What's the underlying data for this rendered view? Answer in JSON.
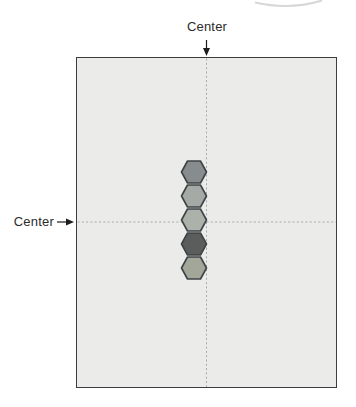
{
  "figure": {
    "labels": {
      "top_center": "Center",
      "left_center": "Center"
    }
  },
  "colors": {
    "page_background": "#ffffff",
    "board_fill": "#ebebea",
    "board_border": "#3d3d3d",
    "center_line": "#a9a9a9",
    "arrow": "#1d1d1d",
    "label_text": "#2b2b2b",
    "hexagon_stroke": "#3e4345",
    "clipped_arc": "#cdcdcd"
  },
  "geometry": {
    "board": {
      "left": 76,
      "top": 57,
      "width": 261,
      "height": 331
    },
    "vertical_center_x": 206.5,
    "horizontal_center_y": 222
  },
  "hexagon_size": {
    "width": 25,
    "height": 22
  },
  "hexagons": [
    {
      "cx": 194,
      "cy": 172,
      "fill": "#878c8e"
    },
    {
      "cx": 194,
      "cy": 196,
      "fill": "#a5aaa7"
    },
    {
      "cx": 194,
      "cy": 220,
      "fill": "#acb1aa"
    },
    {
      "cx": 194,
      "cy": 244,
      "fill": "#5a5d5c"
    },
    {
      "cx": 194,
      "cy": 268,
      "fill": "#a2a79a"
    }
  ]
}
